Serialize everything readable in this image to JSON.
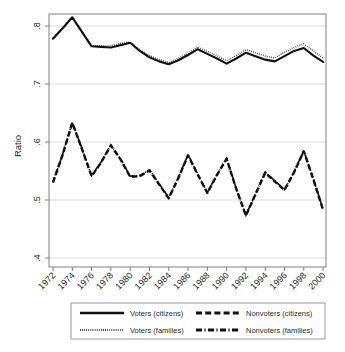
{
  "chart_data": {
    "type": "line",
    "title": "",
    "xlabel": "",
    "ylabel": "Ratio",
    "ylim": [
      0.4,
      0.84
    ],
    "xlim": [
      1972,
      2000
    ],
    "yticks": [
      ".4",
      ".5",
      ".6",
      ".7",
      ".8"
    ],
    "ytick_values": [
      0.4,
      0.5,
      0.6,
      0.7,
      0.8
    ],
    "xticks": [
      "1972",
      "1974",
      "1976",
      "1978",
      "1980",
      "1982",
      "1984",
      "1986",
      "1988",
      "1990",
      "1992",
      "1994",
      "1996",
      "1998",
      "2000"
    ],
    "xtick_values": [
      1972,
      1974,
      1976,
      1978,
      1980,
      1982,
      1984,
      1986,
      1988,
      1990,
      1992,
      1994,
      1996,
      1998,
      2000
    ],
    "grid": true,
    "legend_position": "below",
    "x": [
      1972,
      1973,
      1974,
      1975,
      1976,
      1977,
      1978,
      1979,
      1980,
      1981,
      1982,
      1983,
      1984,
      1985,
      1986,
      1987,
      1988,
      1989,
      1990,
      1991,
      1992,
      1993,
      1994,
      1995,
      1996,
      1997,
      1998,
      1999,
      2000
    ],
    "series": [
      {
        "name": "Voters (citizens)",
        "style": "solid",
        "values": [
          0.778,
          0.796,
          0.815,
          0.79,
          0.765,
          0.764,
          0.763,
          0.767,
          0.771,
          0.757,
          0.746,
          0.739,
          0.734,
          0.741,
          0.75,
          0.76,
          0.752,
          0.744,
          0.735,
          0.744,
          0.754,
          0.748,
          0.742,
          0.739,
          0.748,
          0.757,
          0.762,
          0.749,
          0.738
        ]
      },
      {
        "name": "Voters (families)",
        "style": "dotted",
        "values": [
          0.779,
          0.797,
          0.816,
          0.791,
          0.766,
          0.766,
          0.766,
          0.77,
          0.772,
          0.759,
          0.749,
          0.742,
          0.737,
          0.744,
          0.753,
          0.764,
          0.756,
          0.749,
          0.74,
          0.749,
          0.759,
          0.754,
          0.748,
          0.745,
          0.755,
          0.763,
          0.769,
          0.757,
          0.745
        ]
      },
      {
        "name": "Nonvoters (citizens)",
        "style": "dashed",
        "values": [
          0.53,
          0.578,
          0.633,
          0.588,
          0.541,
          0.565,
          0.594,
          0.57,
          0.54,
          0.541,
          0.551,
          0.527,
          0.503,
          0.538,
          0.577,
          0.544,
          0.512,
          0.543,
          0.571,
          0.519,
          0.473,
          0.51,
          0.547,
          0.532,
          0.517,
          0.548,
          0.584,
          0.535,
          0.483
        ]
      },
      {
        "name": "Nonvoters (families)",
        "style": "dashdot",
        "values": [
          0.531,
          0.579,
          0.634,
          0.589,
          0.542,
          0.566,
          0.595,
          0.571,
          0.541,
          0.542,
          0.552,
          0.528,
          0.504,
          0.539,
          0.578,
          0.545,
          0.513,
          0.544,
          0.572,
          0.52,
          0.474,
          0.511,
          0.548,
          0.533,
          0.518,
          0.549,
          0.585,
          0.536,
          0.484
        ]
      }
    ],
    "legend": [
      {
        "label": "Voters (citizens)",
        "style": "solid"
      },
      {
        "label": "Nonvoters (citizens)",
        "style": "dashed"
      },
      {
        "label": "Voters (families)",
        "style": "dotted"
      },
      {
        "label": "Nonvoters (families)",
        "style": "dashdot"
      }
    ],
    "colors": {
      "line": "#111111",
      "grid": "#d9d9d9",
      "frame": "#808080",
      "text": "#2b2b2b",
      "background": "#ffffff"
    }
  }
}
